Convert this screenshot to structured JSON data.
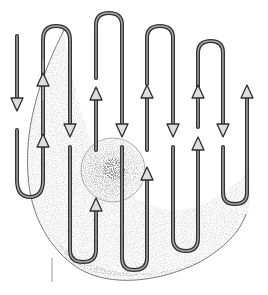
{
  "illustration": {
    "subject": "Breast self-examination vertical strip pattern",
    "description": "Engraved-style illustration of a breast with a continuous up-and-down serpentine path of arrows covering the breast in vertical strips",
    "colors": {
      "background": "#ffffff",
      "stroke": "#3a3a3a",
      "stroke_inner": "#9a9a9a",
      "shading": "#c8c8c8",
      "areola": "#b5b5b5"
    },
    "strips": [
      {
        "index": 1,
        "x": 17,
        "direction": "down"
      },
      {
        "index": 2,
        "x": 43,
        "direction": "up"
      },
      {
        "index": 3,
        "x": 70,
        "direction": "down"
      },
      {
        "index": 4,
        "x": 96,
        "direction": "up"
      },
      {
        "index": 5,
        "x": 122,
        "direction": "down"
      },
      {
        "index": 6,
        "x": 147,
        "direction": "up"
      },
      {
        "index": 7,
        "x": 173,
        "direction": "down"
      },
      {
        "index": 8,
        "x": 198,
        "direction": "up"
      },
      {
        "index": 9,
        "x": 223,
        "direction": "down"
      },
      {
        "index": 10,
        "x": 247,
        "direction": "up"
      }
    ],
    "icons": {
      "arrow_down": "arrow-down-icon",
      "arrow_up": "arrow-up-icon"
    }
  }
}
